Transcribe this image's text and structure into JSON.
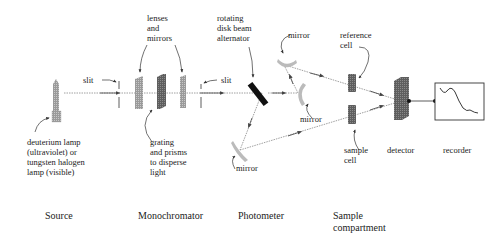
{
  "diagram": {
    "type": "spectrophotometer-schematic",
    "labels": {
      "slit_left": "slit",
      "slit_right": "slit",
      "lenses_mirrors": "lenses\nand\nmirrors",
      "rotating_disk": "rotating\ndisk beam\nalternator",
      "mirror_top": "mirror",
      "mirror_mid": "mirror",
      "mirror_bottom": "mirror",
      "reference_cell": "reference\ncell",
      "sample_cell": "sample\ncell",
      "detector": "detector",
      "recorder": "recorder",
      "lamp": "deuterium lamp\n(ultraviolet) or\ntungsten halogen\nlamp (visible)",
      "grating": "grating\nand prisms\nto disperse\nlight"
    },
    "sections": [
      {
        "id": "source",
        "label": "Source"
      },
      {
        "id": "monochromator",
        "label": "Monochromator"
      },
      {
        "id": "photometer",
        "label": "Photometer"
      },
      {
        "id": "sample",
        "label": "Sample\ncompartment"
      }
    ],
    "colors": {
      "component_light": "#b8b8b8",
      "component_dark": "#6f6f6f",
      "beam_alternator": "#111111",
      "beam": "#777777",
      "ink": "#222222"
    }
  }
}
